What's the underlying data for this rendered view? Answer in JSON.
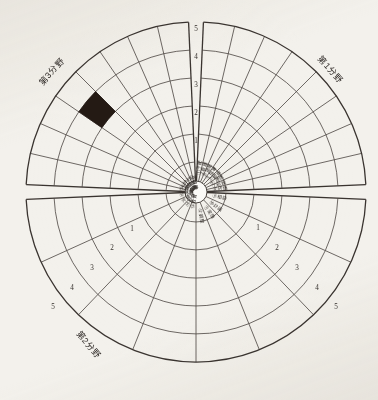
{
  "figure": {
    "title": "",
    "background_color": "#f3f1ec",
    "line_color": "#4a4440",
    "highlight_color": "#241a14"
  },
  "center": {
    "x": 196,
    "y": 192,
    "hub_radius": 11
  },
  "geometry": {
    "ring_count": 5,
    "ring_radii": [
      30,
      58,
      86,
      114,
      142,
      170
    ],
    "gap_degrees": 5
  },
  "field_labels": [
    {
      "text": "第1分野",
      "x": 330,
      "y": 70,
      "rotation": 48
    },
    {
      "text": "第2分野",
      "x": 88,
      "y": 345,
      "rotation": 50
    },
    {
      "text": "第3分野",
      "x": 52,
      "y": 72,
      "rotation": -48
    }
  ],
  "axis_scales": [
    {
      "name": "top-axis",
      "labels": [
        "5",
        "4",
        "3",
        "2",
        "1"
      ],
      "positions": [
        {
          "x": 196,
          "y": 29
        },
        {
          "x": 196,
          "y": 57
        },
        {
          "x": 196,
          "y": 85
        },
        {
          "x": 196,
          "y": 113
        },
        {
          "x": 196,
          "y": 141
        }
      ]
    },
    {
      "name": "lower-right-axis",
      "labels": [
        "1",
        "2",
        "3",
        "4",
        "5"
      ],
      "positions": [
        {
          "x": 258,
          "y": 228
        },
        {
          "x": 277,
          "y": 248
        },
        {
          "x": 297,
          "y": 268
        },
        {
          "x": 317,
          "y": 288
        },
        {
          "x": 336,
          "y": 307
        }
      ]
    },
    {
      "name": "lower-left-axis",
      "labels": [
        "1",
        "2",
        "3",
        "4",
        "5"
      ],
      "positions": [
        {
          "x": 132,
          "y": 229
        },
        {
          "x": 112,
          "y": 248
        },
        {
          "x": 92,
          "y": 268
        },
        {
          "x": 72,
          "y": 288
        },
        {
          "x": 53,
          "y": 307
        }
      ]
    }
  ],
  "chart_data": {
    "type": "pie",
    "title": "",
    "subtitle": "",
    "xlabel": "",
    "ylabel": "",
    "ylim": [
      0,
      5
    ],
    "grid": true,
    "legend_position": "none",
    "radial_scale": {
      "min": 0,
      "max": 5,
      "ticks": [
        1,
        2,
        3,
        4,
        5
      ],
      "tick_labels": [
        "1",
        "2",
        "3",
        "4",
        "5"
      ]
    },
    "fields": [
      {
        "name": "第1分野",
        "start_deg": 2.5,
        "end_deg": 87.5,
        "sector_count": 8
      },
      {
        "name": "第2分野",
        "start_deg": 92.5,
        "end_deg": 267.5,
        "sector_count": 8
      },
      {
        "name": "第3分野",
        "start_deg": 272.5,
        "end_deg": 357.5,
        "sector_count": 8
      }
    ],
    "categories": [
      "①予防",
      "②看護",
      "③援助",
      "④指導",
      "⑤観察",
      "⑥連携",
      "⑦記録",
      "⑧評価",
      "⑨相談",
      "⑩計画",
      "⑪実施",
      "⑫調整",
      "⑬教育",
      "⑭安全",
      "⑮倫理",
      "⑯技術",
      "⑰管理",
      "⑱情報",
      "⑲支援",
      "⑳研究",
      "㉑判断",
      "㉒協働",
      "㉓継続",
      "㉔改善"
    ],
    "values": [
      0,
      0,
      0,
      0,
      0,
      0,
      0,
      0,
      0,
      0,
      0,
      0,
      0,
      0,
      0,
      0,
      0,
      0,
      0,
      4,
      0,
      0,
      0,
      0
    ],
    "filled_cells": [
      {
        "sector_index": 19,
        "ring_from": 3,
        "ring_to": 4,
        "color": "#241a14"
      }
    ],
    "annotations": []
  },
  "item_labels": [
    {
      "text": "①予防",
      "sector": 0
    },
    {
      "text": "②看護",
      "sector": 1
    },
    {
      "text": "③援助",
      "sector": 2
    },
    {
      "text": "④指導",
      "sector": 3
    },
    {
      "text": "⑤観察",
      "sector": 4
    },
    {
      "text": "⑥連携",
      "sector": 5
    },
    {
      "text": "⑦記録",
      "sector": 6
    },
    {
      "text": "⑧評価",
      "sector": 7
    },
    {
      "text": "⑨相談",
      "sector": 8
    },
    {
      "text": "⑩計画",
      "sector": 9
    },
    {
      "text": "⑪実施",
      "sector": 10
    },
    {
      "text": "⑫調整",
      "sector": 11
    },
    {
      "text": "⑬教育",
      "sector": 12
    },
    {
      "text": "⑭安全",
      "sector": 13
    },
    {
      "text": "⑮倫理",
      "sector": 14
    },
    {
      "text": "⑯技術",
      "sector": 15
    },
    {
      "text": "⑰管理",
      "sector": 16
    },
    {
      "text": "⑱情報",
      "sector": 17
    },
    {
      "text": "⑲支援",
      "sector": 18
    },
    {
      "text": "⑳研究",
      "sector": 19
    },
    {
      "text": "㉑判断",
      "sector": 20
    },
    {
      "text": "㉒協働",
      "sector": 21
    },
    {
      "text": "㉓継続",
      "sector": 22
    },
    {
      "text": "㉔改善",
      "sector": 23
    }
  ]
}
